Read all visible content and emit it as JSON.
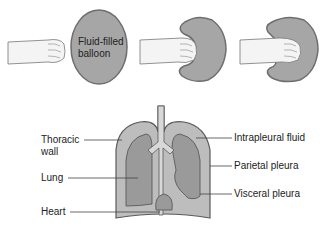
{
  "diagram": {
    "top_panel": {
      "balloon_label_line1": "Fluid-filled",
      "balloon_label_line2": "balloon",
      "stages": [
        "fist-approaching",
        "fist-pressing",
        "fist-enclosed"
      ]
    },
    "bottom_panel": {
      "left_labels": {
        "thoracic_wall_line1": "Thoracic",
        "thoracic_wall_line2": "wall",
        "lung": "Lung",
        "heart": "Heart"
      },
      "right_labels": {
        "intrapleural_fluid": "Intrapleural fluid",
        "parietal_pleura": "Parietal pleura",
        "visceral_pleura": "Visceral pleura"
      }
    },
    "colors": {
      "balloon_fill": "#a6a6a6",
      "balloon_stroke": "#6e6e6e",
      "pleura_fill": "#bdbdbd",
      "lung_fill": "#9a9a9a",
      "outline": "#5a5a5a",
      "skin": "#f2f2f2"
    }
  }
}
